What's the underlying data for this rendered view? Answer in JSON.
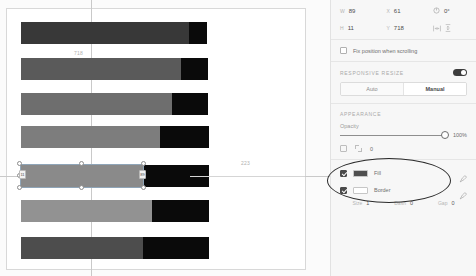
{
  "canvas": {
    "measure_top": "718",
    "measure_right": "223",
    "selected_badge_left": "11",
    "selected_badge_right": "89",
    "bars": [
      {
        "name": "bar-1",
        "top": 22,
        "left": 21,
        "body_width": 168,
        "cap_width": 18,
        "body_color": "#383838"
      },
      {
        "name": "bar-2",
        "top": 58,
        "left": 21,
        "body_width": 160,
        "cap_width": 27,
        "body_color": "#5a5a5a"
      },
      {
        "name": "bar-3",
        "top": 93,
        "left": 21,
        "body_width": 151,
        "cap_width": 36,
        "body_color": "#6e6e6e"
      },
      {
        "name": "bar-4",
        "top": 126,
        "left": 21,
        "body_width": 139,
        "cap_width": 49,
        "body_color": "#7d7d7d"
      },
      {
        "name": "bar-5-selected",
        "top": 165,
        "left": 21,
        "body_width": 122,
        "cap_width": 66,
        "body_color": "#8a8a8a"
      },
      {
        "name": "bar-6",
        "top": 200,
        "left": 21,
        "body_width": 131,
        "cap_width": 57,
        "body_color": "#929292"
      },
      {
        "name": "bar-7",
        "top": 237,
        "left": 21,
        "body_width": 122,
        "cap_width": 66,
        "body_color": "#4d4d4d"
      }
    ]
  },
  "panel": {
    "dimensions": {
      "width_key": "W",
      "width_value": "89",
      "x_key": "X",
      "x_value": "61",
      "rotation_value": "0°",
      "height_key": "H",
      "height_value": "11",
      "y_key": "Y",
      "y_value": "718",
      "corner_value": ""
    },
    "fix_position": {
      "label": "Fix position when scrolling",
      "checked": false
    },
    "responsive_resize": {
      "title": "Responsive resize",
      "toggle_on": true,
      "auto_label": "Auto",
      "manual_label": "Manual",
      "active": "Manual"
    },
    "appearance": {
      "title": "Appearance",
      "opacity_label": "Opacity",
      "opacity_value": "100%",
      "corner_value": "0"
    },
    "paint": {
      "fill": {
        "label": "Fill",
        "checked": true,
        "color": "#4f4f4f"
      },
      "border": {
        "label": "Border",
        "checked": true,
        "color": "#ffffff"
      }
    },
    "stroke": {
      "size_key": "Size",
      "size_value": "1",
      "dash_key": "Dash",
      "dash_value": "0",
      "gap_key": "Gap",
      "gap_value": "0"
    }
  }
}
